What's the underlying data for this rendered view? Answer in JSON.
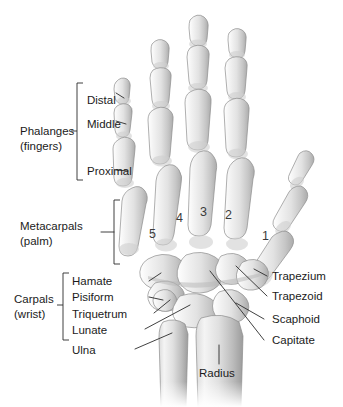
{
  "figure": {
    "view": "dorsal view, right hand",
    "background_color": "#ffffff",
    "text_color": "#1b1b1b",
    "bone_color": "#d8d8d8",
    "bone_outline_color": "#8d8d8d"
  },
  "group_labels": [
    {
      "id": "phalanges",
      "line1": "Phalanges",
      "line2": "(fingers)",
      "bracket": true
    },
    {
      "id": "metacarpals",
      "line1": "Metacarpals",
      "line2": "(palm)",
      "bracket": true
    },
    {
      "id": "carpals",
      "line1": "Carpals",
      "line2": "(wrist)",
      "bracket": true
    }
  ],
  "phalanx_labels": [
    {
      "id": "distal",
      "label": "Distal"
    },
    {
      "id": "middle",
      "label": "Middle"
    },
    {
      "id": "proximal",
      "label": "Proximal"
    }
  ],
  "metacarpal_numbers": [
    {
      "id": "mc5",
      "label": "5"
    },
    {
      "id": "mc4",
      "label": "4"
    },
    {
      "id": "mc3",
      "label": "3"
    },
    {
      "id": "mc2",
      "label": "2"
    },
    {
      "id": "mc1",
      "label": "1"
    }
  ],
  "carpal_labels_left": [
    {
      "id": "hamate",
      "label": "Hamate"
    },
    {
      "id": "pisiform",
      "label": "Pisiform"
    },
    {
      "id": "triquetrum",
      "label": "Triquetrum"
    },
    {
      "id": "lunate",
      "label": "Lunate"
    }
  ],
  "carpal_labels_right": [
    {
      "id": "trapezium",
      "label": "Trapezium"
    },
    {
      "id": "trapezoid",
      "label": "Trapezoid"
    },
    {
      "id": "scaphoid",
      "label": "Scaphoid"
    },
    {
      "id": "capitate",
      "label": "Capitate"
    }
  ],
  "forearm_labels": [
    {
      "id": "ulna",
      "label": "Ulna"
    },
    {
      "id": "radius",
      "label": "Radius"
    }
  ]
}
